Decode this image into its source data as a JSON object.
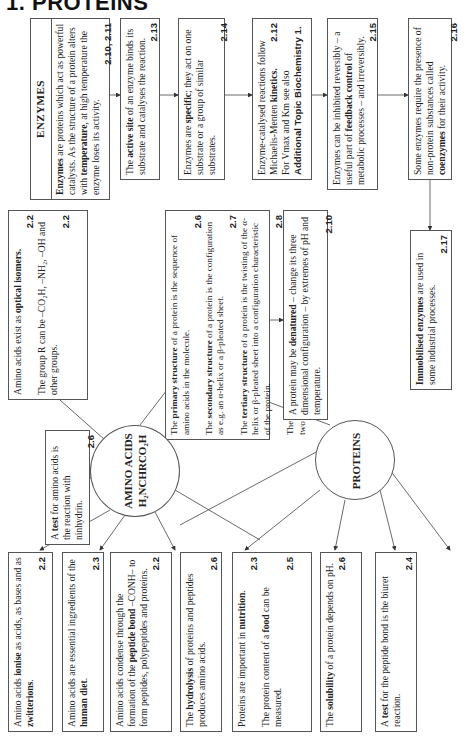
{
  "title": "1. PROTEINS",
  "enzymes": {
    "header": "ENZYMES",
    "intro": {
      "pre": "",
      "bold1": "Enzymes",
      "mid1": " are proteins which act as powerful catalysts. As the structure of a protein alters with ",
      "bold2": "temperature",
      "post": ", at high temperature the enzyme loses its activity.",
      "ref": "2.10, 2.11"
    },
    "active_site": {
      "pre": "The ",
      "bold": "active site",
      "post": " of an enzyme binds its substrate and catalyses the reaction.",
      "ref": "2.13"
    },
    "specific": {
      "pre": "Enzymes are ",
      "bold": "specific",
      "post": "; they act on one substrate or a group of similar substrates.",
      "ref": "2.14"
    },
    "kinetics": {
      "pre": "Enzyme-catalysed reactions follow Michaelis-Menten ",
      "bold": "kinetics.",
      "ref": "2.12",
      "line2": "For Vmax and Km see also ",
      "bold2": "Additional Topic Biochemistry 1."
    },
    "inhibition": {
      "pre": "Enzymes can be inhibited reversibly – a useful part of ",
      "bold": "feedback control",
      "post": " of metabolic processes – and irreversibly.",
      "ref": "2.15"
    },
    "coenzymes": {
      "pre": "Some enzymes require the presence of non-protein substances called ",
      "bold": "coenzymes",
      "post": " for their activity.",
      "ref": "2.16"
    },
    "immobilised": {
      "bold": "Immobilised enzymes",
      "post": " are used in some industrial processes.",
      "ref": "2.17"
    }
  },
  "structure": {
    "primary": {
      "pre": "The ",
      "bold": "primary structure",
      "post": " of a protein is the sequence of amino acids in the molecule.",
      "ref": "2.6"
    },
    "secondary": {
      "pre": "The ",
      "bold": "secondary structure",
      "post": " of a protein is the configuration as e.g. an α-helix or a β-pleated sheet.",
      "ref": "2.7"
    },
    "tertiary": {
      "pre": "The ",
      "bold": "tertiary structure",
      "post": " of a protein is the twisting of the α-helix or β-pleated sheet into a configuration characteristic of the protein.",
      "ref": "2.8"
    },
    "quaternary": {
      "pre": "The ",
      "bold": "quaternary structure",
      "post": " of a protein is the grouping of two or more tertiary structures into a unit.",
      "ref": "2.9"
    }
  },
  "denatured": {
    "pre": "A protein may be ",
    "bold": "denatured",
    "post": " – change its three dimensional configuration – by extremes of pH and temperature.",
    "ref": "2.10"
  },
  "optical": {
    "pre": "Amino acids exist as ",
    "bold": "optical isomers.",
    "ref1": "2.2",
    "line2": "The group R can be –CO₂H, –NH₂, –OH and other groups.",
    "ref2": "2.2"
  },
  "amino_circle": {
    "line1": "AMINO ACIDS",
    "line2": "H₂NCHRCO₂H"
  },
  "protein_circle": {
    "label": "PROTEINS"
  },
  "amino_test": {
    "pre": "A ",
    "bold": "test",
    "post": " for amino acids is the reaction with ninhydrin.",
    "ref": "2.6"
  },
  "bottom": {
    "ionise": {
      "pre": "Amino acids ",
      "bold": "ionise",
      "mid": " as acids, as bases and as ",
      "bold2": "zwitterions",
      "post": ".",
      "ref": "2.2"
    },
    "diet": {
      "pre": "Amino acids are essential ingredients of the ",
      "bold": "human diet",
      "post": ".",
      "ref": "2.3"
    },
    "peptide": {
      "pre": "Amino acids condense through the formation of the ",
      "bold": "peptide bond",
      "post": " –CONH– to form peptides, polypeptides and proteins.",
      "ref": "2.2"
    },
    "hydrolysis": {
      "pre": "The ",
      "bold": "hydrolysis",
      "post": " of proteins and peptides produces amino acids.",
      "ref": "2.6"
    },
    "nutrition": {
      "pre": "Proteins are important in ",
      "bold": "nutrition",
      "post": ".",
      "ref": "2.3",
      "line2pre": "The protein content of a ",
      "bold2": "food",
      "line2post": " can be measured.",
      "ref2": "2.5"
    },
    "solubility": {
      "pre": "The ",
      "bold": "solubility",
      "post": " of a protein depends on pH.",
      "ref": "2.6"
    },
    "biuret": {
      "pre": "A ",
      "bold": "test",
      "post": " for the peptide bond is the biuret reaction.",
      "ref": "2.4"
    }
  }
}
